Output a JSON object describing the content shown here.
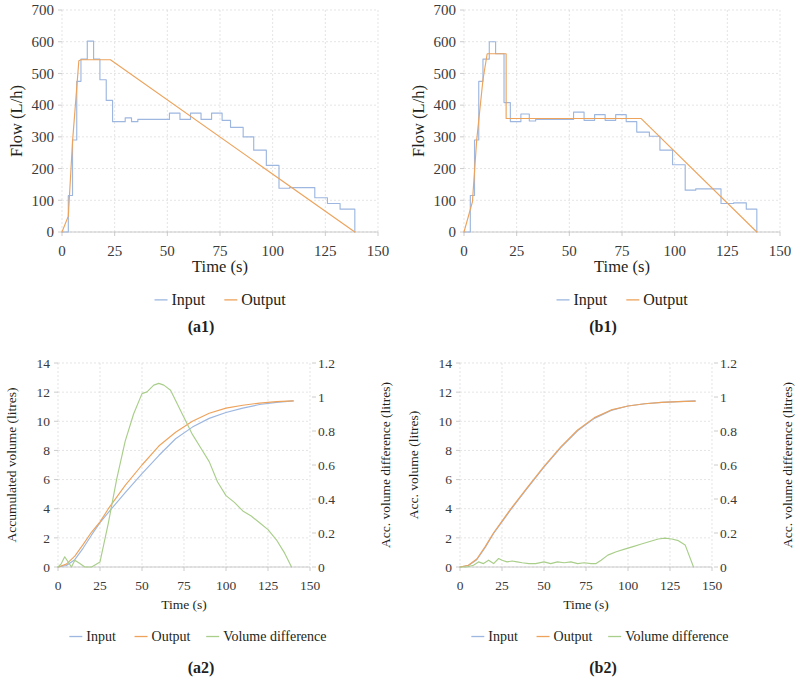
{
  "figure": {
    "panels": [
      "a1",
      "b1",
      "a2",
      "b2"
    ]
  },
  "colors": {
    "input": "#9DB7E0",
    "output": "#EDA35C",
    "difference": "#A9CE8A",
    "grid": "#d9d9d9",
    "axis": "#bfbfbf",
    "text": "#231f20"
  },
  "panel_a1": {
    "caption": "(a1)",
    "xlabel": "Time (s)",
    "ylabel": "Flow (L/h)",
    "xticks": [
      "0",
      "25",
      "50",
      "75",
      "100",
      "125",
      "150"
    ],
    "yticks": [
      "0",
      "100",
      "200",
      "300",
      "400",
      "500",
      "600",
      "700"
    ],
    "legend": [
      {
        "label": "Input",
        "color_key": "input"
      },
      {
        "label": "Output",
        "color_key": "output"
      }
    ]
  },
  "panel_b1": {
    "caption": "(b1)",
    "xlabel": "Time (s)",
    "ylabel": "Flow (L/h)",
    "xticks": [
      "0",
      "25",
      "50",
      "75",
      "100",
      "125",
      "150"
    ],
    "yticks": [
      "0",
      "100",
      "200",
      "300",
      "400",
      "500",
      "600",
      "700"
    ],
    "legend": [
      {
        "label": "Input",
        "color_key": "input"
      },
      {
        "label": "Output",
        "color_key": "output"
      }
    ]
  },
  "panel_a2": {
    "caption": "(a2)",
    "xlabel": "Time (s)",
    "ylabel": "Accumulated volume (litres)",
    "ylabel_right": "Acc. volume difference (litres)",
    "xticks": [
      "0",
      "25",
      "50",
      "75",
      "100",
      "125",
      "150"
    ],
    "yticks": [
      "0",
      "2",
      "4",
      "6",
      "8",
      "10",
      "12",
      "14"
    ],
    "yticks_right": [
      "0",
      "0.2",
      "0.4",
      "0.6",
      "0.8",
      "1",
      "1.2"
    ],
    "legend": [
      {
        "label": "Input",
        "color_key": "input"
      },
      {
        "label": "Output",
        "color_key": "output"
      },
      {
        "label": "Volume difference",
        "color_key": "difference"
      }
    ]
  },
  "panel_b2": {
    "caption": "(b2)",
    "xlabel": "Time (s)",
    "ylabel": "Acc. volume (litres)",
    "ylabel_right": "Acc. volume difference (litres)",
    "xticks": [
      "0",
      "25",
      "50",
      "75",
      "100",
      "125",
      "150"
    ],
    "yticks": [
      "0",
      "2",
      "4",
      "6",
      "8",
      "10",
      "12",
      "14"
    ],
    "yticks_right": [
      "0",
      "0.2",
      "0.4",
      "0.6",
      "0.8",
      "1",
      "1.2"
    ],
    "legend": [
      {
        "label": "Input",
        "color_key": "input"
      },
      {
        "label": "Output",
        "color_key": "output"
      },
      {
        "label": "Volume difference",
        "color_key": "difference"
      }
    ]
  },
  "chart_data": [
    {
      "id": "a1",
      "type": "line",
      "title": "(a1)",
      "xlabel": "Time (s)",
      "ylabel": "Flow (L/h)",
      "xlim": [
        0,
        150
      ],
      "ylim": [
        0,
        700
      ],
      "xticks": [
        0,
        25,
        50,
        75,
        100,
        125,
        150
      ],
      "yticks": [
        0,
        100,
        200,
        300,
        400,
        500,
        600,
        700
      ],
      "grid": true,
      "legend_position": "bottom",
      "series": [
        {
          "name": "Input",
          "color": "#9DB7E0",
          "step": true,
          "x": [
            0,
            3,
            3,
            5,
            5,
            7,
            7,
            9,
            9,
            12,
            12,
            15,
            15,
            18,
            18,
            21,
            21,
            24,
            24,
            30,
            30,
            33,
            33,
            36,
            36,
            51,
            51,
            56,
            56,
            61,
            61,
            66,
            66,
            71,
            71,
            76,
            76,
            80,
            80,
            86,
            86,
            91,
            91,
            97,
            97,
            103,
            103,
            108,
            108,
            120,
            120,
            126,
            126,
            132,
            132,
            139,
            139
          ],
          "y": [
            0,
            0,
            115,
            115,
            290,
            290,
            475,
            475,
            545,
            545,
            602,
            602,
            545,
            545,
            480,
            480,
            415,
            415,
            348,
            348,
            360,
            360,
            348,
            348,
            355,
            355,
            375,
            375,
            355,
            355,
            375,
            375,
            355,
            355,
            375,
            375,
            352,
            352,
            330,
            330,
            300,
            300,
            258,
            258,
            210,
            210,
            138,
            138,
            140,
            140,
            108,
            108,
            90,
            90,
            72,
            72,
            0
          ]
        },
        {
          "name": "Output",
          "color": "#EDA35C",
          "step": false,
          "x": [
            0,
            3,
            5,
            8,
            9,
            23,
            139
          ],
          "y": [
            0,
            50,
            285,
            540,
            543,
            543,
            0
          ]
        }
      ]
    },
    {
      "id": "b1",
      "type": "line",
      "title": "(b1)",
      "xlabel": "Time (s)",
      "ylabel": "Flow (L/h)",
      "xlim": [
        0,
        150
      ],
      "ylim": [
        0,
        700
      ],
      "xticks": [
        0,
        25,
        50,
        75,
        100,
        125,
        150
      ],
      "yticks": [
        0,
        100,
        200,
        300,
        400,
        500,
        600,
        700
      ],
      "grid": true,
      "legend_position": "bottom",
      "series": [
        {
          "name": "Input",
          "color": "#9DB7E0",
          "step": true,
          "x": [
            0,
            3,
            3,
            5,
            5,
            7,
            7,
            9,
            9,
            12,
            12,
            15,
            15,
            19,
            19,
            22,
            22,
            27,
            27,
            31,
            31,
            34,
            34,
            52,
            52,
            57,
            57,
            62,
            62,
            67,
            67,
            72,
            72,
            77,
            77,
            82,
            82,
            88,
            88,
            93,
            93,
            99,
            99,
            105,
            105,
            110,
            110,
            122,
            122,
            128,
            128,
            134,
            134,
            139,
            139
          ],
          "y": [
            0,
            0,
            115,
            115,
            290,
            290,
            475,
            475,
            545,
            545,
            600,
            600,
            562,
            562,
            408,
            408,
            348,
            348,
            372,
            372,
            350,
            350,
            355,
            355,
            378,
            378,
            352,
            352,
            370,
            370,
            352,
            352,
            370,
            370,
            348,
            348,
            315,
            315,
            302,
            302,
            258,
            258,
            212,
            212,
            132,
            132,
            136,
            136,
            90,
            90,
            92,
            92,
            72,
            72,
            0
          ]
        },
        {
          "name": "Output",
          "color": "#EDA35C",
          "step": true,
          "x": [
            0,
            4,
            6,
            9,
            11,
            11,
            20,
            20,
            24,
            24,
            84,
            84,
            139
          ],
          "y": [
            0,
            95,
            288,
            480,
            562,
            562,
            562,
            358,
            358,
            358,
            358,
            358,
            0
          ]
        }
      ]
    },
    {
      "id": "a2",
      "type": "line",
      "title": "(a2)",
      "xlabel": "Time (s)",
      "ylabel": "Accumulated volume (litres)",
      "ylabel_right": "Acc. volume difference (litres)",
      "xlim": [
        0,
        150
      ],
      "ylim": [
        0,
        14
      ],
      "ylim_right": [
        0,
        1.2
      ],
      "xticks": [
        0,
        25,
        50,
        75,
        100,
        125,
        150
      ],
      "yticks": [
        0,
        2,
        4,
        6,
        8,
        10,
        12,
        14
      ],
      "yticks_right": [
        0,
        0.2,
        0.4,
        0.6,
        0.8,
        1,
        1.2
      ],
      "grid": true,
      "legend_position": "bottom",
      "series": [
        {
          "name": "Input",
          "color": "#9DB7E0",
          "axis": "left",
          "x": [
            0,
            5,
            10,
            15,
            20,
            25,
            30,
            40,
            50,
            60,
            70,
            80,
            90,
            100,
            110,
            120,
            130,
            140
          ],
          "y": [
            0.0,
            0.1,
            0.5,
            1.3,
            2.2,
            3.05,
            3.75,
            5.1,
            6.4,
            7.65,
            8.8,
            9.6,
            10.2,
            10.6,
            10.9,
            11.15,
            11.3,
            11.4
          ]
        },
        {
          "name": "Output",
          "color": "#EDA35C",
          "axis": "left",
          "x": [
            0,
            5,
            10,
            15,
            20,
            25,
            30,
            40,
            50,
            60,
            70,
            80,
            90,
            100,
            110,
            120,
            130,
            140
          ],
          "y": [
            0.0,
            0.2,
            0.75,
            1.55,
            2.4,
            3.1,
            4.0,
            5.6,
            7.0,
            8.3,
            9.25,
            10.0,
            10.55,
            10.9,
            11.1,
            11.25,
            11.35,
            11.4
          ]
        },
        {
          "name": "Volume difference",
          "color": "#A9CE8A",
          "axis": "right",
          "x": [
            0,
            2,
            4,
            6,
            8,
            10,
            13,
            16,
            20,
            25,
            30,
            35,
            40,
            45,
            50,
            53,
            57,
            60,
            63,
            67,
            70,
            75,
            80,
            85,
            90,
            95,
            100,
            105,
            110,
            115,
            120,
            125,
            130,
            135,
            139
          ],
          "y": [
            0.0,
            0.02,
            0.06,
            0.03,
            0.0,
            0.04,
            0.02,
            0.0,
            0.0,
            0.03,
            0.26,
            0.52,
            0.74,
            0.9,
            1.02,
            1.03,
            1.07,
            1.08,
            1.07,
            1.04,
            0.98,
            0.88,
            0.78,
            0.7,
            0.62,
            0.5,
            0.42,
            0.38,
            0.33,
            0.3,
            0.26,
            0.22,
            0.16,
            0.08,
            0.0
          ]
        }
      ]
    },
    {
      "id": "b2",
      "type": "line",
      "title": "(b2)",
      "xlabel": "Time (s)",
      "ylabel": "Acc. volume (litres)",
      "ylabel_right": "Acc. volume difference (litres)",
      "xlim": [
        0,
        150
      ],
      "ylim": [
        0,
        14
      ],
      "ylim_right": [
        0,
        1.2
      ],
      "xticks": [
        0,
        25,
        50,
        75,
        100,
        125,
        150
      ],
      "yticks": [
        0,
        2,
        4,
        6,
        8,
        10,
        12,
        14
      ],
      "yticks_right": [
        0,
        0.2,
        0.4,
        0.6,
        0.8,
        1,
        1.2
      ],
      "grid": true,
      "legend_position": "bottom",
      "series": [
        {
          "name": "Input",
          "color": "#9DB7E0",
          "axis": "left",
          "x": [
            0,
            5,
            10,
            15,
            20,
            25,
            30,
            40,
            50,
            60,
            70,
            80,
            90,
            100,
            110,
            120,
            130,
            140
          ],
          "y": [
            0.0,
            0.1,
            0.5,
            1.35,
            2.3,
            3.1,
            3.9,
            5.4,
            6.85,
            8.2,
            9.35,
            10.2,
            10.75,
            11.05,
            11.2,
            11.3,
            11.35,
            11.4
          ]
        },
        {
          "name": "Output",
          "color": "#EDA35C",
          "axis": "left",
          "x": [
            0,
            5,
            10,
            15,
            20,
            25,
            30,
            40,
            50,
            60,
            70,
            80,
            90,
            100,
            110,
            120,
            130,
            140
          ],
          "y": [
            0.0,
            0.12,
            0.55,
            1.4,
            2.35,
            3.15,
            3.95,
            5.45,
            6.9,
            8.25,
            9.4,
            10.25,
            10.78,
            11.05,
            11.2,
            11.3,
            11.35,
            11.38
          ]
        },
        {
          "name": "Volume difference",
          "color": "#A9CE8A",
          "axis": "right",
          "x": [
            0,
            4,
            8,
            11,
            14,
            17,
            20,
            23,
            25,
            28,
            31,
            34,
            37,
            41,
            45,
            50,
            54,
            58,
            62,
            66,
            70,
            74,
            78,
            81,
            84,
            88,
            93,
            98,
            103,
            108,
            113,
            118,
            122,
            126,
            130,
            134,
            139
          ],
          "y": [
            0.0,
            0.0,
            0.01,
            0.03,
            0.02,
            0.04,
            0.02,
            0.05,
            0.04,
            0.03,
            0.035,
            0.03,
            0.025,
            0.02,
            0.02,
            0.03,
            0.02,
            0.03,
            0.025,
            0.03,
            0.02,
            0.025,
            0.02,
            0.02,
            0.04,
            0.07,
            0.09,
            0.105,
            0.12,
            0.135,
            0.15,
            0.165,
            0.17,
            0.165,
            0.155,
            0.13,
            0.0
          ]
        }
      ]
    }
  ]
}
